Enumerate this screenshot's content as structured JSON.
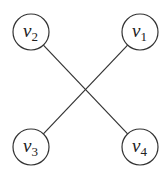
{
  "diagram": {
    "type": "graph",
    "nodes": [
      {
        "id": "v1",
        "label": "v",
        "subscript": "1",
        "position": "top-right"
      },
      {
        "id": "v2",
        "label": "v",
        "subscript": "2",
        "position": "top-left"
      },
      {
        "id": "v3",
        "label": "v",
        "subscript": "3",
        "position": "bottom-left"
      },
      {
        "id": "v4",
        "label": "v",
        "subscript": "4",
        "position": "bottom-right"
      }
    ],
    "edges": [
      {
        "from": "v2",
        "to": "v4"
      },
      {
        "from": "v1",
        "to": "v3"
      }
    ],
    "colors": {
      "stroke": "#333333",
      "text": "#222222",
      "background": "#ffffff"
    }
  }
}
